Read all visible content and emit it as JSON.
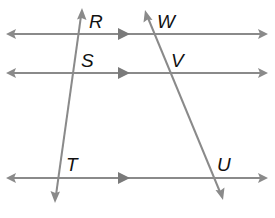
{
  "diagram": {
    "colors": {
      "line": "#8a8a8a",
      "label": "#111111",
      "background": "#ffffff"
    },
    "parallel_lines": [
      {
        "id": "line-1",
        "y": 34,
        "x1": 6,
        "x2": 268,
        "mid_arrow_x": 124
      },
      {
        "id": "line-2",
        "y": 73,
        "x1": 6,
        "x2": 268,
        "mid_arrow_x": 124
      },
      {
        "id": "line-3",
        "y": 178,
        "x1": 6,
        "x2": 268,
        "mid_arrow_x": 124
      }
    ],
    "transversals": [
      {
        "id": "transversal-left",
        "x1": 82,
        "y1": 9,
        "x2": 55,
        "y2": 202
      },
      {
        "id": "transversal-right",
        "x1": 145,
        "y1": 11,
        "x2": 223,
        "y2": 199
      }
    ],
    "labels": {
      "R": "R",
      "S": "S",
      "T": "T",
      "W": "W",
      "V": "V",
      "U": "U"
    }
  }
}
